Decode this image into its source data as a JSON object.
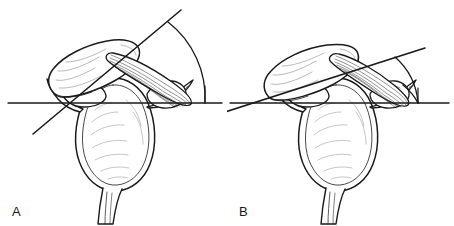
{
  "figure": {
    "background_color": "#ffffff",
    "ink_color": "#1a1a1a",
    "fill_color": "#ffffff",
    "width": 454,
    "height": 226
  },
  "panels": [
    {
      "id": "a",
      "label": "A",
      "description": "Axial anatomical line drawing with horizontal reference line and steeply inclined measurement line",
      "reference_line": {
        "name": "horizontal-reference-line",
        "x1": 8,
        "y1": 103,
        "x2": 222,
        "y2": 103
      },
      "measurement_line": {
        "name": "oblique-measurement-line",
        "x1": 33,
        "y1": 134,
        "x2": 181,
        "y2": 10
      },
      "angle_arc": {
        "name": "angle-arc",
        "vertex_x": 205,
        "vertex_y": 103,
        "radius": 96,
        "start_x": 205,
        "start_y": 7,
        "end_x": 205,
        "end_y": 103,
        "sweep_description": "large arc from oblique line down to horizontal line"
      },
      "angle_size": "large"
    },
    {
      "id": "b",
      "label": "B",
      "description": "Axial anatomical line drawing with horizontal reference line and shallowly inclined measurement line",
      "reference_line": {
        "name": "horizontal-reference-line",
        "x1": 3,
        "y1": 103,
        "x2": 222,
        "y2": 103
      },
      "measurement_line": {
        "name": "oblique-measurement-line",
        "x1": -5,
        "y1": 113,
        "x2": 198,
        "y2": 48
      },
      "angle_arc": {
        "name": "angle-arc",
        "vertex_x": 191,
        "vertex_y": 103,
        "radius": 58,
        "sweep_description": "small arc from oblique line down to horizontal line"
      },
      "angle_size": "small"
    }
  ],
  "anatomy": {
    "structures": [
      {
        "name": "vertebral-body",
        "label": "vertebral body"
      },
      {
        "name": "transverse-process-left",
        "label": "left transverse process"
      },
      {
        "name": "transverse-process-right",
        "label": "right transverse process"
      },
      {
        "name": "spinous-process",
        "label": "spinous process"
      },
      {
        "name": "overlying-bone",
        "label": "overlying elongated bone"
      },
      {
        "name": "striated-ligament",
        "label": "striated muscle / ligament band"
      }
    ]
  }
}
